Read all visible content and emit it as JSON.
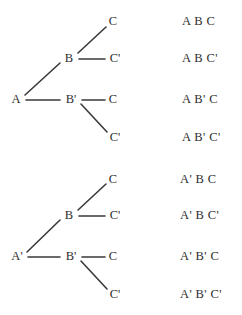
{
  "figure": {
    "background_color": "#ffffff",
    "line_color": "#3a3a3a",
    "text_color": "#2e2e2e",
    "trees": [
      {
        "name": "upper-tree",
        "root": "A",
        "nodes": [
          {
            "label": "A",
            "x": 16,
            "y": 99
          },
          {
            "label": "B",
            "x": 69,
            "y": 58
          },
          {
            "label": "B'",
            "x": 71,
            "y": 99
          },
          {
            "label": "C",
            "x": 113,
            "y": 21
          },
          {
            "label": "C'",
            "x": 115,
            "y": 58
          },
          {
            "label": "C",
            "x": 113,
            "y": 99
          },
          {
            "label": "C'",
            "x": 115,
            "y": 137
          }
        ],
        "edges": [
          {
            "x1": 25,
            "y1": 95,
            "x2": 60,
            "y2": 63
          },
          {
            "x1": 26,
            "y1": 100,
            "x2": 60,
            "y2": 100
          },
          {
            "x1": 78,
            "y1": 53,
            "x2": 106,
            "y2": 27
          },
          {
            "x1": 79,
            "y1": 59,
            "x2": 105,
            "y2": 59
          },
          {
            "x1": 82,
            "y1": 100,
            "x2": 105,
            "y2": 100
          },
          {
            "x1": 81,
            "y1": 104,
            "x2": 107,
            "y2": 132
          }
        ]
      },
      {
        "name": "lower-tree",
        "root": "A'",
        "nodes": [
          {
            "label": "A'",
            "x": 17,
            "y": 256
          },
          {
            "label": "B",
            "x": 69,
            "y": 215
          },
          {
            "label": "B'",
            "x": 71,
            "y": 256
          },
          {
            "label": "C",
            "x": 113,
            "y": 179
          },
          {
            "label": "C'",
            "x": 115,
            "y": 215
          },
          {
            "label": "C",
            "x": 113,
            "y": 256
          },
          {
            "label": "C'",
            "x": 115,
            "y": 294
          }
        ],
        "edges": [
          {
            "x1": 27,
            "y1": 252,
            "x2": 60,
            "y2": 220
          },
          {
            "x1": 28,
            "y1": 257,
            "x2": 60,
            "y2": 257
          },
          {
            "x1": 78,
            "y1": 210,
            "x2": 106,
            "y2": 184
          },
          {
            "x1": 79,
            "y1": 216,
            "x2": 105,
            "y2": 216
          },
          {
            "x1": 82,
            "y1": 257,
            "x2": 105,
            "y2": 257
          },
          {
            "x1": 81,
            "y1": 261,
            "x2": 107,
            "y2": 289
          }
        ]
      }
    ],
    "paths": [
      {
        "text": "A B C",
        "x": 182,
        "y": 21
      },
      {
        "text": "A B C'",
        "x": 182,
        "y": 58
      },
      {
        "text": "A B' C",
        "x": 182,
        "y": 99
      },
      {
        "text": "A B' C'",
        "x": 182,
        "y": 137
      },
      {
        "text": "A' B C",
        "x": 180,
        "y": 179
      },
      {
        "text": "A' B C'",
        "x": 180,
        "y": 215
      },
      {
        "text": "A' B' C",
        "x": 180,
        "y": 256
      },
      {
        "text": "A' B' C'",
        "x": 180,
        "y": 294
      }
    ]
  }
}
